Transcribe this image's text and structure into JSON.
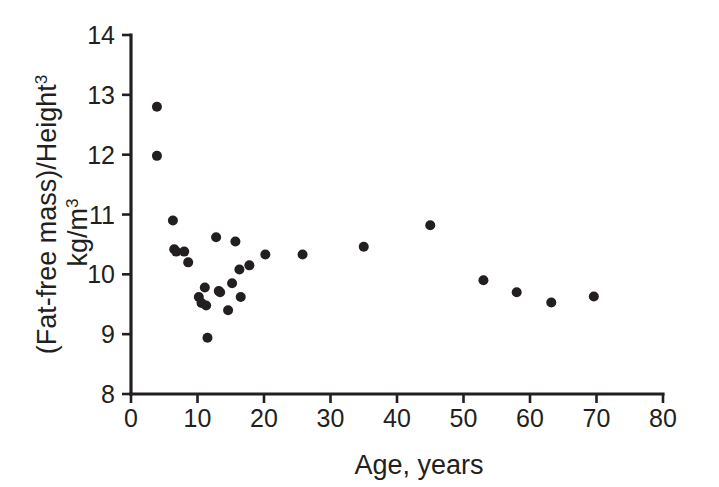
{
  "chart_data": {
    "type": "scatter",
    "title": "",
    "xlabel": "Age, years",
    "ylabel_line1": "(Fat-free mass)/Height",
    "ylabel_line1_sup": "3",
    "ylabel_line2": "kg/m",
    "ylabel_line2_sup": "3",
    "ylabel_full": "(Fat-free mass)/Height3 kg/m3",
    "xlim": [
      0,
      80
    ],
    "ylim": [
      8,
      14
    ],
    "xticks": [
      0,
      10,
      20,
      30,
      40,
      50,
      60,
      70,
      80
    ],
    "xtick_labels": [
      "0",
      "10",
      "20",
      "30",
      "40",
      "50",
      "60",
      "70",
      "80"
    ],
    "yticks": [
      8,
      9,
      10,
      11,
      12,
      13,
      14
    ],
    "ytick_labels": [
      "8",
      "9",
      "10",
      "11",
      "12",
      "13",
      "14"
    ],
    "grid": false,
    "legend": null,
    "marker": "filled-circle",
    "marker_color": "#231f20",
    "marker_size_px": 9,
    "x": [
      3.9,
      3.9,
      6.3,
      6.5,
      6.8,
      8.0,
      8.6,
      10.2,
      10.6,
      11.1,
      11.3,
      11.5,
      12.8,
      13.2,
      13.4,
      14.6,
      15.2,
      15.7,
      16.3,
      16.5,
      17.8,
      20.2,
      25.8,
      35.0,
      45.0,
      53.0,
      58.0,
      63.2,
      69.6
    ],
    "y": [
      12.8,
      11.98,
      10.9,
      10.42,
      10.38,
      10.38,
      10.2,
      9.62,
      9.52,
      9.78,
      9.48,
      8.94,
      10.62,
      9.72,
      9.7,
      9.4,
      9.85,
      10.55,
      10.08,
      9.62,
      10.15,
      10.33,
      10.33,
      10.46,
      10.82,
      9.9,
      9.7,
      9.53,
      9.63
    ],
    "points": [
      {
        "age": 3.9,
        "value": 12.8
      },
      {
        "age": 3.9,
        "value": 11.98
      },
      {
        "age": 6.3,
        "value": 10.9
      },
      {
        "age": 6.5,
        "value": 10.42
      },
      {
        "age": 6.8,
        "value": 10.38
      },
      {
        "age": 8.0,
        "value": 10.38
      },
      {
        "age": 8.6,
        "value": 10.2
      },
      {
        "age": 10.2,
        "value": 9.62
      },
      {
        "age": 10.6,
        "value": 9.52
      },
      {
        "age": 11.1,
        "value": 9.78
      },
      {
        "age": 11.3,
        "value": 9.48
      },
      {
        "age": 11.5,
        "value": 8.94
      },
      {
        "age": 12.8,
        "value": 10.62
      },
      {
        "age": 13.2,
        "value": 9.72
      },
      {
        "age": 13.4,
        "value": 9.7
      },
      {
        "age": 14.6,
        "value": 9.4
      },
      {
        "age": 15.2,
        "value": 9.85
      },
      {
        "age": 15.7,
        "value": 10.55
      },
      {
        "age": 16.3,
        "value": 10.08
      },
      {
        "age": 16.5,
        "value": 9.62
      },
      {
        "age": 17.8,
        "value": 10.15
      },
      {
        "age": 20.2,
        "value": 10.33
      },
      {
        "age": 25.8,
        "value": 10.33
      },
      {
        "age": 35.0,
        "value": 10.46
      },
      {
        "age": 45.0,
        "value": 10.82
      },
      {
        "age": 53.0,
        "value": 9.9
      },
      {
        "age": 58.0,
        "value": 9.7
      },
      {
        "age": 63.2,
        "value": 9.53
      },
      {
        "age": 69.6,
        "value": 9.63
      }
    ]
  },
  "geometry": {
    "plot_left_px": 131,
    "plot_right_px": 663,
    "plot_top_px": 35,
    "plot_bottom_px": 394,
    "tick_len_px": 9
  }
}
